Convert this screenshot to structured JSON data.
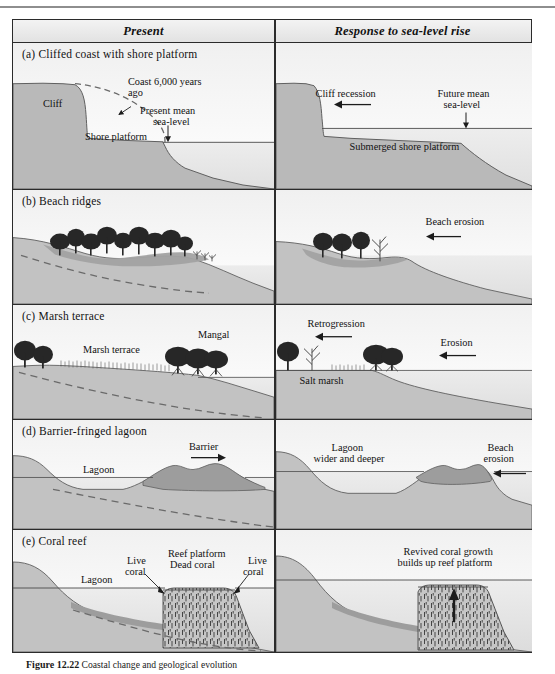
{
  "figure": {
    "caption_label": "Figure 12.22",
    "caption_text": "Coastal change and geological evolution"
  },
  "table": {
    "headers": [
      {
        "label": "Present"
      },
      {
        "label": "Response to sea-level rise"
      }
    ],
    "rows": [
      {
        "id": "a",
        "marker": "(a)",
        "title": "Cliffed coast with shore platform",
        "present_labels": [
          "Cliff",
          "Coast 6,000 years",
          "ago",
          "Shore platform",
          "Present mean",
          "sea-level"
        ],
        "response_labels": [
          "Cliff recession",
          "Future mean",
          "sea-level",
          "Submerged shore platform"
        ]
      },
      {
        "id": "b",
        "marker": "(b)",
        "title": "Beach ridges",
        "present_labels": [],
        "response_labels": [
          "Beach erosion"
        ]
      },
      {
        "id": "c",
        "marker": "(c)",
        "title": "Marsh terrace",
        "present_labels": [
          "Marsh terrace",
          "Mangal"
        ],
        "response_labels": [
          "Retrogression",
          "Erosion",
          "Salt marsh"
        ]
      },
      {
        "id": "d",
        "marker": "(d)",
        "title": "Barrier-fringed lagoon",
        "present_labels": [
          "Lagoon",
          "Barrier"
        ],
        "response_labels": [
          "Lagoon",
          "wider and deeper",
          "Beach",
          "erosion"
        ]
      },
      {
        "id": "e",
        "marker": "(e)",
        "title": "Coral reef",
        "present_labels": [
          "Lagoon",
          "Live",
          "coral",
          "Reef platform",
          "Dead coral",
          "Live",
          "coral"
        ],
        "response_labels": [
          "Revived coral growth",
          "builds up reef platform"
        ]
      }
    ]
  },
  "colors": {
    "land": "#b9b9b9",
    "land_dark": "#a8a8a8",
    "water": "#e9e9e9",
    "sky": "#fbfbfb",
    "ink": "#3a3a3a",
    "outline": "#2b2b2b",
    "tree": "#2a2a2a",
    "reef": "#c9c9c9"
  }
}
